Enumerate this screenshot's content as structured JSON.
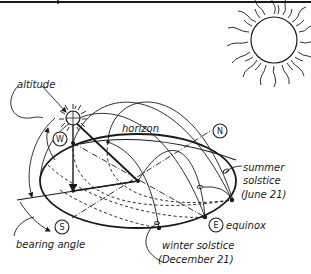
{
  "diagram": {
    "labels": {
      "altitude": "altitude",
      "horizon": "horizon",
      "bearing_angle": "bearing angle",
      "summer_solstice_line1": "summer",
      "summer_solstice_line2": "solstice",
      "summer_solstice_line3": "(June 21)",
      "equinox": "equinox",
      "winter_solstice_line1": "winter solstice",
      "winter_solstice_line2": "(December 21)"
    },
    "compass": {
      "north": "N",
      "south": "S",
      "east": "E",
      "west": "W"
    },
    "colors": {
      "ink": "#1a1a1a",
      "background": "#ffffff"
    }
  }
}
